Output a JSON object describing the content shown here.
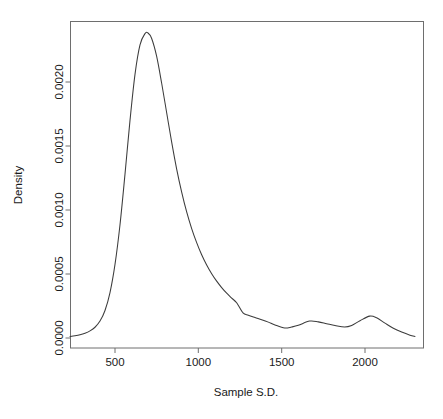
{
  "chart_data": {
    "type": "line",
    "title": "",
    "subtitle": "",
    "xlabel": "Sample S.D.",
    "ylabel": "Density",
    "xlim": [
      230,
      2300
    ],
    "ylim": [
      0.0,
      0.00245
    ],
    "grid": false,
    "legend": false,
    "legend_position": "none",
    "x_ticks": [
      500,
      1000,
      1500,
      2000
    ],
    "x_tick_labels": [
      "500",
      "1000",
      "1500",
      "2000"
    ],
    "y_ticks": [
      0.0,
      0.0005,
      0.001,
      0.0015,
      0.002
    ],
    "y_tick_labels": [
      "0.0000",
      "0.0005",
      "0.0010",
      "0.0015",
      "0.0020"
    ],
    "series": [
      {
        "name": "Density",
        "color": "#3c3c3c",
        "x": [
          230,
          260,
          290,
          320,
          350,
          380,
          410,
          440,
          470,
          500,
          530,
          560,
          590,
          620,
          650,
          680,
          698,
          720,
          750,
          780,
          810,
          840,
          870,
          900,
          930,
          960,
          990,
          1020,
          1050,
          1080,
          1110,
          1140,
          1170,
          1200,
          1230,
          1268,
          1300,
          1340,
          1380,
          1420,
          1460,
          1518,
          1560,
          1600,
          1668,
          1720,
          1770,
          1820,
          1878,
          1920,
          1970,
          2028,
          2070,
          2120,
          2170,
          2220,
          2270,
          2300
        ],
        "y": [
          1.2e-05,
          1.8e-05,
          2.6e-05,
          3.8e-05,
          5.6e-05,
          8.4e-05,
          0.000132,
          0.000215,
          0.000355,
          0.000575,
          0.000885,
          0.00128,
          0.0017,
          0.00206,
          0.00229,
          0.002378,
          0.002383,
          0.00234,
          0.0022,
          0.00199,
          0.00176,
          0.00153,
          0.00132,
          0.00114,
          0.000985,
          0.000855,
          0.000745,
          0.00065,
          0.00057,
          0.000502,
          0.000444,
          0.000394,
          0.00035,
          0.000312,
          0.000275,
          0.000196,
          0.000178,
          0.00016,
          0.000143,
          0.000124,
          0.000102,
          7.8e-05,
          8.6e-05,
          9.9e-05,
          0.000132,
          0.000126,
          0.000112,
          9.8e-05,
          8.6e-05,
          9.8e-05,
          0.000135,
          0.000171,
          0.000158,
          0.000116,
          7.6e-05,
          4.6e-05,
          2.2e-05,
          1.2e-05
        ]
      }
    ],
    "annotations": [],
    "peak": {
      "x": 698,
      "y": 0.002383
    },
    "local_extrema": [
      {
        "kind": "shoulder",
        "x": 1268,
        "y": 0.000196
      },
      {
        "kind": "minimum",
        "x": 1518,
        "y": 7.8e-05
      },
      {
        "kind": "maximum",
        "x": 1668,
        "y": 0.000132
      },
      {
        "kind": "minimum",
        "x": 1878,
        "y": 8.6e-05
      },
      {
        "kind": "maximum",
        "x": 2028,
        "y": 0.000171
      }
    ]
  },
  "axes": {
    "x_title": "Sample S.D.",
    "y_title": "Density"
  }
}
